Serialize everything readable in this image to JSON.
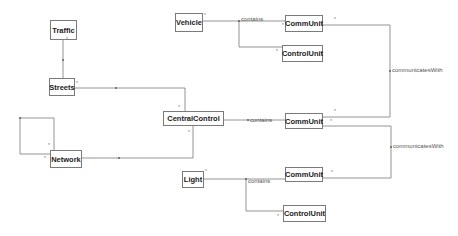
{
  "diagram": {
    "type": "uml-class-diagram",
    "classes": [
      {
        "id": "traffic",
        "name": "Traffic"
      },
      {
        "id": "streets",
        "name": "Streets"
      },
      {
        "id": "network",
        "name": "Network"
      },
      {
        "id": "central",
        "name": "CentralControl"
      },
      {
        "id": "vehicle",
        "name": "Vehicle"
      },
      {
        "id": "comm1",
        "name": "CommUnit"
      },
      {
        "id": "ctrl1",
        "name": "ControlUnit"
      },
      {
        "id": "comm2",
        "name": "CommUnit"
      },
      {
        "id": "comm3",
        "name": "CommUnit"
      },
      {
        "id": "light",
        "name": "Light"
      },
      {
        "id": "ctrl2",
        "name": "ControlUnit"
      }
    ],
    "labels": {
      "contains_vehicle": "contains",
      "contains_central": "contains",
      "contains_light": "contains",
      "comm_top": "communicatesWith",
      "comm_bottom": "communicatesWith"
    },
    "multiplicity": "*"
  }
}
